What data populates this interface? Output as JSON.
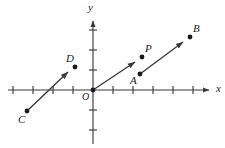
{
  "figure": {
    "type": "vector-diagram",
    "background_color": "#ffffff",
    "stroke_color": "#3a3a3a",
    "label_color": "#1a1a1a"
  },
  "axes": {
    "x_label": "x",
    "y_label": "y",
    "origin_label": "O",
    "origin_px": {
      "x": 93,
      "y": 90
    },
    "tick_spacing_px": 20,
    "x_axis": {
      "start_px": {
        "x": 8,
        "y": 90
      },
      "end_px": {
        "x": 212,
        "y": 90
      },
      "arrow": "right",
      "tick_offsets": [
        -80,
        -60,
        -40,
        -20,
        20,
        40,
        60,
        80,
        100
      ],
      "tick_half_length_px": 4
    },
    "y_axis": {
      "start_px": {
        "x": 93,
        "y": 144
      },
      "end_px": {
        "x": 93,
        "y": 18
      },
      "arrow": "up",
      "tick_offsets": [
        -40,
        -20,
        20,
        40,
        60
      ],
      "tick_half_length_px": 4
    },
    "x_label_px": {
      "x": 216,
      "y": 84
    },
    "y_label_px": {
      "x": 88,
      "y": 2
    },
    "origin_label_px": {
      "x": 82,
      "y": 92
    }
  },
  "vectors": [
    {
      "name": "CD",
      "tail_point": "C",
      "head_point": "D",
      "tail_px": {
        "x": 27,
        "y": 111
      },
      "head_px": {
        "x": 73,
        "y": 68
      },
      "arrow": true
    },
    {
      "name": "OP",
      "tail_point": "O",
      "head_point": "P",
      "tail_px": {
        "x": 93,
        "y": 90
      },
      "head_px": {
        "x": 140,
        "y": 58
      },
      "arrow": true
    },
    {
      "name": "AB",
      "tail_point": "A",
      "head_point": "B",
      "tail_px": {
        "x": 140,
        "y": 74
      },
      "head_px": {
        "x": 188,
        "y": 38
      },
      "arrow": true
    }
  ],
  "points": [
    {
      "label": "C",
      "dot_px": {
        "x": 27,
        "y": 111
      },
      "label_px": {
        "x": 18,
        "y": 115
      }
    },
    {
      "label": "D",
      "dot_px": {
        "x": 75,
        "y": 67
      },
      "label_px": {
        "x": 66,
        "y": 54
      }
    },
    {
      "label": "P",
      "dot_px": {
        "x": 142,
        "y": 57
      },
      "label_px": {
        "x": 144,
        "y": 44
      }
    },
    {
      "label": "A",
      "dot_px": {
        "x": 140,
        "y": 74
      },
      "label_px": {
        "x": 131,
        "y": 76
      }
    },
    {
      "label": "B",
      "dot_px": {
        "x": 190,
        "y": 37
      },
      "label_px": {
        "x": 192,
        "y": 24
      }
    }
  ],
  "dot_radius_px": 2.4
}
